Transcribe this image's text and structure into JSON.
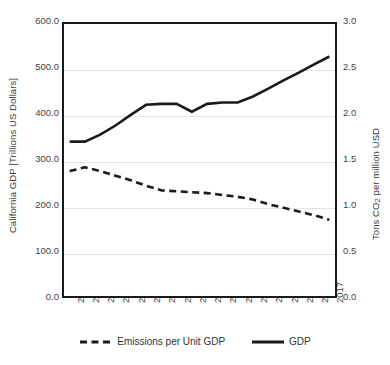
{
  "chart_data": {
    "type": "line",
    "title": "",
    "subtitle": "",
    "xlabel": "",
    "ylabel": "California GDP [Trillions US Dollars]",
    "ylabel_right": "Tons CO2 per million USD",
    "grid": true,
    "legend_position": "bottom",
    "categories": [
      "2000",
      "2001",
      "2002",
      "2003",
      "2004",
      "2005",
      "2006",
      "2007",
      "2008",
      "2009",
      "2010",
      "2011",
      "2012",
      "2013",
      "2014",
      "2015",
      "2016",
      "2017"
    ],
    "x": [
      2000,
      2001,
      2002,
      2003,
      2004,
      2005,
      2006,
      2007,
      2008,
      2009,
      2010,
      2011,
      2012,
      2013,
      2014,
      2015,
      2016,
      2017
    ],
    "ylim": [
      0,
      600
    ],
    "ylim_right": [
      0,
      3.0
    ],
    "yticks": [
      "0.0",
      "100.0",
      "200.0",
      "300.0",
      "400.0",
      "500.0",
      "600.0"
    ],
    "yticks_right": [
      "0.0",
      "0.5",
      "1.0",
      "1.5",
      "2.0",
      "2.5",
      "3.0"
    ],
    "series": [
      {
        "name": "GDP",
        "axis": "left",
        "style": "solid",
        "color": "#1a1a1a",
        "values": [
          340,
          340,
          355,
          375,
          398,
          420,
          422,
          422,
          405,
          422,
          425,
          425,
          438,
          455,
          473,
          490,
          508,
          525
        ]
      },
      {
        "name": "Emissions per Unit GDP",
        "axis": "right",
        "style": "dashed",
        "color": "#1a1a1a",
        "values": [
          1.38,
          1.42,
          1.38,
          1.33,
          1.28,
          1.22,
          1.17,
          1.16,
          1.15,
          1.14,
          1.12,
          1.1,
          1.07,
          1.02,
          0.98,
          0.94,
          0.9,
          0.85
        ]
      }
    ]
  },
  "axes": {
    "left_title": "California GDP [Trillions US Dollars]",
    "right_title_pre": "Tons CO",
    "right_title_sub": "2",
    "right_title_post": " per million USD"
  },
  "legend": {
    "items": [
      {
        "label": "Emissions per Unit GDP",
        "marker": "dashed-line-swatch"
      },
      {
        "label": "GDP",
        "marker": "solid-line-swatch"
      }
    ]
  }
}
